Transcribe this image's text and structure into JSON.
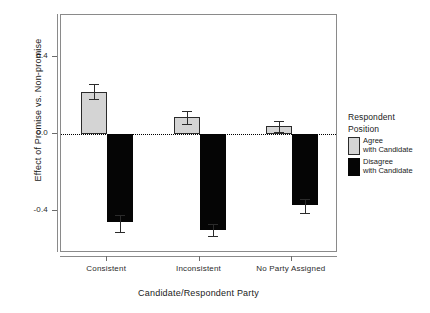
{
  "chart_data": {
    "type": "bar",
    "title": "",
    "subtitle": "",
    "xlabel": "Candidate/Respondent Party",
    "ylabel": "Effect of Promise vs. Non-promise",
    "categories": [
      "Consistent",
      "Inconsistent",
      "No Party Assigned"
    ],
    "ylim": [
      -0.62,
      0.62
    ],
    "yticks": [
      0.4,
      0.0,
      -0.4
    ],
    "ytick_labels": [
      "0.4",
      "0.0",
      "-0.4"
    ],
    "grid": false,
    "zero_reference_line": 0.0,
    "legend_position": "right",
    "series": [
      {
        "name": "Agree with Candidate",
        "color": "#d4d4d4",
        "values": [
          0.22,
          0.09,
          0.04
        ],
        "error_low": [
          0.18,
          0.05,
          0.01
        ],
        "error_high": [
          0.26,
          0.12,
          0.07
        ]
      },
      {
        "name": "Disagree with Candidate",
        "color": "#050505",
        "values": [
          -0.46,
          -0.5,
          -0.37
        ],
        "error_low": [
          -0.51,
          -0.53,
          -0.41
        ],
        "error_high": [
          -0.42,
          -0.47,
          -0.34
        ]
      }
    ]
  },
  "axes": {
    "y_title": "Effect of Promise vs. Non-promise",
    "x_title": "Candidate/Respondent Party",
    "y_ticks": [
      "0.4",
      "0.0",
      "-0.4"
    ],
    "x_ticks": [
      "Consistent",
      "Inconsistent",
      "No Party Assigned"
    ]
  },
  "legend": {
    "title_line1": "Respondent",
    "title_line2": "Position",
    "items": [
      {
        "label_line1": "Agree",
        "label_line2": "with Candidate",
        "color": "#d4d4d4"
      },
      {
        "label_line1": "Disagree",
        "label_line2": "with Candidate",
        "color": "#050505"
      }
    ]
  },
  "colors": {
    "agree_fill": "#d4d4d4",
    "disagree_fill": "#050505",
    "frame": "#8a8a8a",
    "text": "#1a1a1a",
    "background": "#ffffff"
  }
}
